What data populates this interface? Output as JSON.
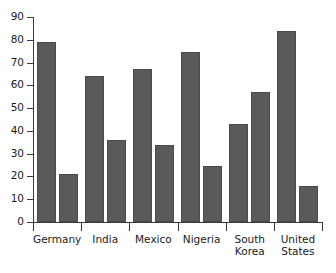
{
  "chart_data": {
    "type": "bar",
    "title": "",
    "xlabel": "",
    "ylabel": "",
    "ylim": [
      0,
      90
    ],
    "ytick_step": 10,
    "yticks": [
      0,
      10,
      20,
      30,
      40,
      50,
      60,
      70,
      80,
      90
    ],
    "grid": false,
    "legend": null,
    "categories": [
      "Germany",
      "India",
      "Mexico",
      "Nigeria",
      "South Korea",
      "United States"
    ],
    "category_label_lines": [
      [
        "Germany"
      ],
      [
        "India"
      ],
      [
        "Mexico"
      ],
      [
        "Nigeria"
      ],
      [
        "South",
        "Korea"
      ],
      [
        "United",
        "States"
      ]
    ],
    "series": [
      {
        "name": "Series 1",
        "values": [
          79,
          64,
          67,
          74.5,
          43,
          84
        ]
      },
      {
        "name": "Series 2",
        "values": [
          21,
          36,
          34,
          24.5,
          57,
          16
        ]
      }
    ],
    "bar_color": "#5a5a5a",
    "bar_outline_color": "#4a4a4a",
    "axis_color": "#3a3a3a",
    "text_color": "#1a1a1a",
    "background_color": "#ffffff"
  }
}
